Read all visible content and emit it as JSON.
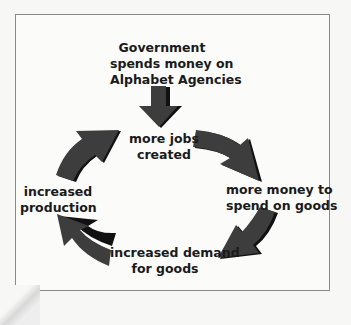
{
  "diagram": {
    "type": "cycle",
    "colors": {
      "arrow": "#3d3d3d",
      "arrow_shadow": "#111111",
      "text": "#1a1a1a",
      "border": "#8a8a8a"
    },
    "start": {
      "lines": [
        "Government",
        "spends money on",
        "Alphabet Agencies"
      ]
    },
    "nodes": [
      {
        "id": "jobs",
        "lines": [
          "more jobs",
          "created"
        ]
      },
      {
        "id": "money",
        "lines": [
          "more money to",
          "spend on goods"
        ]
      },
      {
        "id": "demand",
        "lines": [
          "increased demand",
          "for goods"
        ]
      },
      {
        "id": "production",
        "lines": [
          "increased",
          "production"
        ]
      }
    ],
    "edges": [
      {
        "from": "start",
        "to": "jobs"
      },
      {
        "from": "jobs",
        "to": "money"
      },
      {
        "from": "money",
        "to": "demand"
      },
      {
        "from": "demand",
        "to": "production"
      },
      {
        "from": "production",
        "to": "jobs"
      }
    ]
  }
}
